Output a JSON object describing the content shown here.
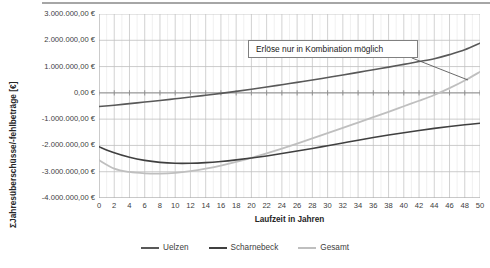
{
  "chart_data": {
    "type": "line",
    "title": "",
    "xlabel": "Laufzeit in Jahren",
    "ylabel": "ΣJahresüberschüsse/-fehlbeträge [€]",
    "xlim": [
      0,
      50
    ],
    "ylim": [
      -4000000,
      3000000
    ],
    "grid": true,
    "legend_position": "bottom",
    "ytick_labels": [
      "3.000.000,00 €",
      "2.000.000,00 €",
      "1.000.000,00 €",
      "0,00 €",
      "-1.000.000,00 €",
      "-2.000.000,00 €",
      "-3.000.000,00 €",
      "-4.000.000,00 €"
    ],
    "ytick_values": [
      3000000,
      2000000,
      1000000,
      0,
      -1000000,
      -2000000,
      -3000000,
      -4000000
    ],
    "xtick_labels": [
      "0",
      "2",
      "4",
      "6",
      "8",
      "10",
      "12",
      "14",
      "16",
      "18",
      "20",
      "22",
      "24",
      "26",
      "28",
      "30",
      "32",
      "34",
      "36",
      "38",
      "40",
      "42",
      "44",
      "46",
      "48",
      "50"
    ],
    "xtick_values": [
      0,
      2,
      4,
      6,
      8,
      10,
      12,
      14,
      16,
      18,
      20,
      22,
      24,
      26,
      28,
      30,
      32,
      34,
      36,
      38,
      40,
      42,
      44,
      46,
      48,
      50
    ],
    "x": [
      0,
      2,
      4,
      6,
      8,
      10,
      12,
      14,
      16,
      18,
      20,
      22,
      24,
      26,
      28,
      30,
      32,
      34,
      36,
      38,
      40,
      42,
      44,
      46,
      48,
      50
    ],
    "series": [
      {
        "name": "Uelzen",
        "color": "#595959",
        "width": 1.6,
        "values": [
          -520000,
          -470000,
          -410000,
          -350000,
          -290000,
          -225000,
          -160000,
          -90000,
          -20000,
          55000,
          135000,
          220000,
          310000,
          400000,
          490000,
          585000,
          680000,
          780000,
          880000,
          980000,
          1085000,
          1190000,
          1300000,
          1455000,
          1640000,
          1890000
        ]
      },
      {
        "name": "Scharnebeck",
        "color": "#404040",
        "width": 1.6,
        "values": [
          -2050000,
          -2280000,
          -2450000,
          -2570000,
          -2645000,
          -2680000,
          -2680000,
          -2655000,
          -2610000,
          -2550000,
          -2480000,
          -2400000,
          -2310000,
          -2215000,
          -2115000,
          -2010000,
          -1905000,
          -1800000,
          -1700000,
          -1605000,
          -1515000,
          -1430000,
          -1350000,
          -1280000,
          -1215000,
          -1155000
        ]
      },
      {
        "name": "Gesamt",
        "color": "#bfbfbf",
        "width": 1.8,
        "values": [
          -2560000,
          -2880000,
          -3010000,
          -3060000,
          -3070000,
          -3045000,
          -2980000,
          -2885000,
          -2765000,
          -2625000,
          -2470000,
          -2300000,
          -2120000,
          -1930000,
          -1735000,
          -1535000,
          -1335000,
          -1130000,
          -925000,
          -720000,
          -510000,
          -300000,
          -80000,
          180000,
          470000,
          800000
        ]
      }
    ],
    "annotations": [
      {
        "name": "callout",
        "text": "Erlöse nur in Kombination möglich",
        "leader_from": {
          "x": 412,
          "y": 58
        },
        "leader_to": {
          "x": 468,
          "y": 80
        }
      }
    ]
  },
  "legend": {
    "items": [
      {
        "label": "Uelzen",
        "color": "#595959"
      },
      {
        "label": "Scharnebeck",
        "color": "#404040"
      },
      {
        "label": "Gesamt",
        "color": "#bfbfbf"
      }
    ]
  },
  "colors": {
    "gridline_major": "#bfbfbf",
    "gridline_minor": "#e6e6e6",
    "axis": "#a6a6a6",
    "text": "#404040",
    "background": "#ffffff"
  }
}
